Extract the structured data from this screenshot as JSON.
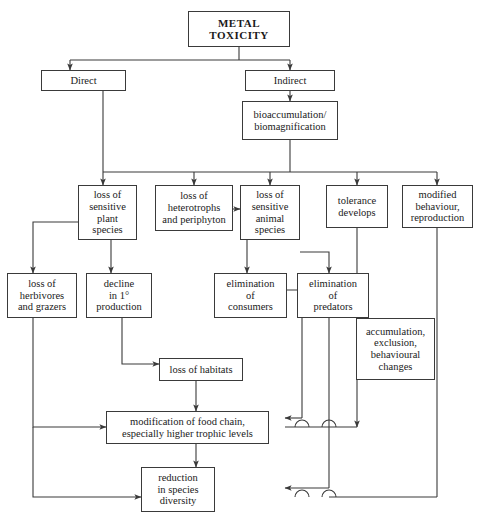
{
  "diagram": {
    "line_color": "#3a3a3a",
    "box_fill": "#ffffff",
    "text_color": "#1a1a1a"
  },
  "nodes": {
    "metal_toxicity": "METAL\nTOXICITY",
    "direct": "Direct",
    "indirect": "Indirect",
    "bioaccumulation": "bioaccumulation/\nbiomagnification",
    "loss_plant": "loss of\nsensitive\nplant\nspecies",
    "loss_heterotrophs": "loss of\nheterotrophs\nand periphyton",
    "loss_animal": "loss of\nsensitive\nanimal\nspecies",
    "tolerance": "tolerance\ndevelops",
    "modified_behaviour": "modified\nbehaviour,\nreproduction",
    "loss_herbivores": "loss of\nherbivores\nand grazers",
    "decline_production": "decline\nin 1°\nproduction",
    "elimination_consumers": "elimination\nof\nconsumers",
    "elimination_predators": "elimination\nof\npredators",
    "accumulation": "accumulation,\nexclusion,\nbehavioural\nchanges",
    "loss_habitats": "loss of habitats",
    "modification_food_chain": "modification of food chain,\nespecially higher trophic levels",
    "reduction_diversity": "reduction\nin species\ndiversity"
  },
  "edges": [
    {
      "from": "metal_toxicity",
      "to": "direct"
    },
    {
      "from": "metal_toxicity",
      "to": "indirect"
    },
    {
      "from": "indirect",
      "to": "bioaccumulation"
    },
    {
      "from": "direct",
      "to": "loss_plant"
    },
    {
      "from": "bioaccumulation",
      "to": "loss_plant"
    },
    {
      "from": "bioaccumulation",
      "to": "loss_heterotrophs"
    },
    {
      "from": "bioaccumulation",
      "to": "loss_animal"
    },
    {
      "from": "bioaccumulation",
      "to": "tolerance"
    },
    {
      "from": "bioaccumulation",
      "to": "modified_behaviour"
    },
    {
      "from": "loss_heterotrophs",
      "to": "loss_animal"
    },
    {
      "from": "loss_plant",
      "to": "loss_herbivores"
    },
    {
      "from": "loss_plant",
      "to": "decline_production"
    },
    {
      "from": "loss_animal",
      "to": "elimination_consumers"
    },
    {
      "from": "loss_animal",
      "to": "elimination_predators"
    },
    {
      "from": "decline_production",
      "to": "loss_habitats"
    },
    {
      "from": "loss_habitats",
      "to": "modification_food_chain"
    },
    {
      "from": "loss_herbivores",
      "to": "modification_food_chain"
    },
    {
      "from": "loss_herbivores",
      "to": "reduction_diversity"
    },
    {
      "from": "elimination_consumers",
      "to": "modification_food_chain"
    },
    {
      "from": "elimination_predators",
      "to": "reduction_diversity"
    },
    {
      "from": "tolerance",
      "to": "accumulation"
    },
    {
      "from": "accumulation",
      "to": "modification_food_chain"
    },
    {
      "from": "modified_behaviour",
      "to": "reduction_diversity"
    },
    {
      "from": "modification_food_chain",
      "to": "reduction_diversity"
    }
  ]
}
